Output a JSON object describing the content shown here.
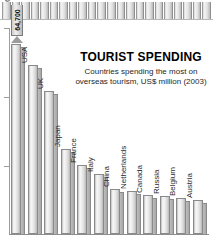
{
  "top_strip": {
    "name": "cropped-chart-strip",
    "bar_count": 22
  },
  "chart_data": {
    "type": "bar",
    "title": "TOURIST SPENDING",
    "subtitle_line1": "Countries spending the most on",
    "subtitle_line2": "overseas tourism, US$ million (2003)",
    "xlabel": "",
    "ylabel": "",
    "ylim": [
      0,
      70000
    ],
    "grid": false,
    "legend": null,
    "value_label": "64,700",
    "value_label_category": "Germany",
    "categories": [
      "Germany",
      "USA",
      "UK",
      "Japan",
      "France",
      "Italy",
      "China",
      "Netherlands",
      "Canada",
      "Russia",
      "Belgium",
      "Austria"
    ],
    "values": [
      64700,
      57400,
      48500,
      28800,
      23400,
      20500,
      15200,
      14600,
      13400,
      12900,
      12400,
      11700
    ]
  }
}
